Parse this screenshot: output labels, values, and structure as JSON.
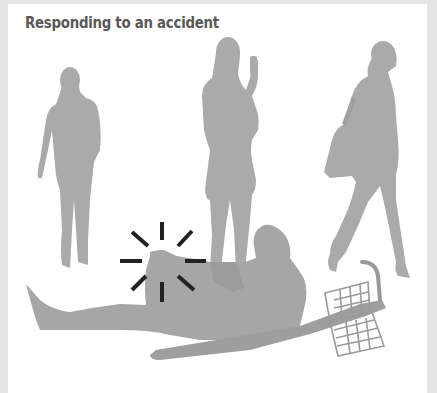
{
  "title": "Responding to an accident",
  "illustration": {
    "description": "Grey silhouettes of three women standing/walking past a person sitting on the ground beside a fallen bicycle, with pain/impact lines around the injured knee",
    "figures": [
      {
        "name": "standing-woman-left"
      },
      {
        "name": "woman-taking-photo-with-phone"
      },
      {
        "name": "woman-walking-with-handbag"
      },
      {
        "name": "injured-cyclist-sitting"
      },
      {
        "name": "fallen-bicycle-with-basket"
      }
    ],
    "colors": {
      "background": "#ffffff",
      "border": "#e4e4e4",
      "silhouette": "#a8a8a8",
      "silhouette_dark": "#9a9a9a",
      "impact_lines": "#222222",
      "title_text": "#595959"
    }
  }
}
